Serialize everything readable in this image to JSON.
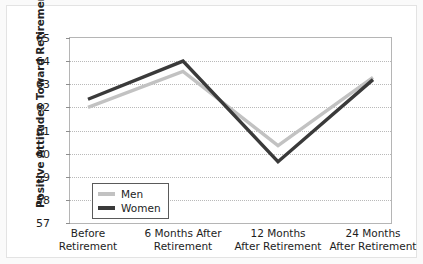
{
  "chart_data": {
    "type": "line",
    "title": "",
    "xlabel": "",
    "ylabel": "Positive Attitudes Toward Retirement",
    "ylim": [
      57,
      65
    ],
    "yticks": [
      57,
      58,
      59,
      60,
      61,
      62,
      63,
      64,
      65
    ],
    "grid": true,
    "legend_position": "lower-left-inside",
    "categories": [
      "Before Retirement",
      "6 Months After Retirement",
      "12 Months After Retirement",
      "24 Months After Retirement"
    ],
    "category_lines": [
      [
        "Before",
        "Retirement"
      ],
      [
        "6 Months After",
        "Retirement"
      ],
      [
        "12 Months",
        "After Retirement"
      ],
      [
        "24 Months",
        "After Retirement"
      ]
    ],
    "series": [
      {
        "name": "Men",
        "color": "#c2c2c2",
        "values": [
          62.0,
          63.55,
          60.35,
          63.3
        ]
      },
      {
        "name": "Women",
        "color": "#3a3a3a",
        "values": [
          62.35,
          64.0,
          59.65,
          63.2
        ]
      }
    ]
  },
  "legend": {
    "entries": [
      {
        "label": "Men",
        "color": "#c2c2c2"
      },
      {
        "label": "Women",
        "color": "#3a3a3a"
      }
    ]
  },
  "axes": {
    "y_title": "Positive Attitudes Toward Retirement"
  }
}
